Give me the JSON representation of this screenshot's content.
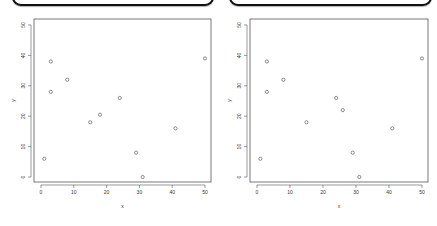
{
  "chart_data": [
    {
      "type": "scatter",
      "title": "",
      "xlabel": "x",
      "ylabel": "y",
      "xlim": [
        0,
        50
      ],
      "ylim": [
        0,
        50
      ],
      "xticks": [
        0,
        10,
        20,
        30,
        40,
        50
      ],
      "yticks": [
        0,
        10,
        20,
        30,
        40,
        50
      ],
      "grid": false,
      "marker": "open-circle",
      "points": [
        {
          "x": 1,
          "y": 6
        },
        {
          "x": 3,
          "y": 38
        },
        {
          "x": 3,
          "y": 28
        },
        {
          "x": 8,
          "y": 32
        },
        {
          "x": 15,
          "y": 18
        },
        {
          "x": 18,
          "y": 20.5
        },
        {
          "x": 24,
          "y": 26
        },
        {
          "x": 29,
          "y": 8
        },
        {
          "x": 31,
          "y": 0
        },
        {
          "x": 41,
          "y": 16
        },
        {
          "x": 50,
          "y": 39
        }
      ]
    },
    {
      "type": "scatter",
      "title": "",
      "xlabel": "x",
      "ylabel": "y",
      "xlim": [
        0,
        50
      ],
      "ylim": [
        0,
        50
      ],
      "xticks": [
        0,
        10,
        20,
        30,
        40,
        50
      ],
      "yticks": [
        0,
        10,
        20,
        30,
        40,
        50
      ],
      "grid": false,
      "marker": "open-circle",
      "points": [
        {
          "x": 1,
          "y": 6
        },
        {
          "x": 3,
          "y": 38
        },
        {
          "x": 3,
          "y": 28
        },
        {
          "x": 8,
          "y": 32
        },
        {
          "x": 15,
          "y": 18
        },
        {
          "x": 24,
          "y": 26
        },
        {
          "x": 26,
          "y": 22
        },
        {
          "x": 29,
          "y": 8
        },
        {
          "x": 31,
          "y": 0
        },
        {
          "x": 41,
          "y": 16
        },
        {
          "x": 50,
          "y": 39
        }
      ]
    }
  ],
  "plots": [
    {
      "xlabel": "x",
      "ylabel": "y"
    },
    {
      "xlabel": "x",
      "ylabel": "y"
    }
  ]
}
